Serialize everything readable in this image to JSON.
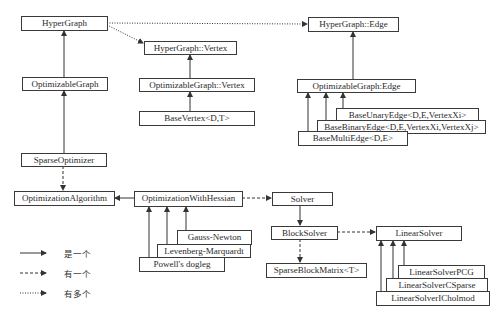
{
  "nodes": {
    "hypergraph": "HyperGraph",
    "hypergraph_vertex": "HyperGraph::Vertex",
    "hypergraph_edge": "HyperGraph::Edge",
    "optimizable_graph": "OptimizableGraph",
    "optimizable_graph_vertex": "OptimizableGraph::Vertex",
    "base_vertex": "BaseVertex<D,T>",
    "optimizable_graph_edge": "OptimizableGraph:Edge",
    "base_unary_edge": "BaseUnaryEdge<D,E,VertexXi>",
    "base_binary_edge": "BaseBinaryEdge<D,E,VertexXi,VertexXj>",
    "base_multi_edge": "BaseMultiEdge<D,E>",
    "sparse_optimizer": "SparseOptimizer",
    "optimization_algorithm": "OptimizationAlgorithm",
    "optimization_with_hessian": "OptimizationWithHessian",
    "gauss_newton": "Gauss-Newton",
    "levenberg_marquardt": "Levenberg-Marquardt",
    "powells_dogleg": "Powell's dogleg",
    "solver": "Solver",
    "block_solver": "BlockSolver",
    "sparse_block_matrix": "SparseBlockMatrix<T>",
    "linear_solver": "LinearSolver",
    "linear_solver_pcg": "LinearSolverPCG",
    "linear_solver_csparse": "LinearSolverCSparse",
    "linear_solver_icholmod": "LinearSolverICholmod"
  },
  "legend": {
    "is_a": "是一个",
    "has_a": "有一个",
    "has_many": "有多个"
  },
  "edges": [
    {
      "from": "optimizable_graph",
      "to": "hypergraph",
      "type": "is_a"
    },
    {
      "from": "hypergraph",
      "to": "hypergraph_vertex",
      "type": "has_many"
    },
    {
      "from": "hypergraph",
      "to": "hypergraph_edge",
      "type": "has_many"
    },
    {
      "from": "optimizable_graph_vertex",
      "to": "hypergraph_vertex",
      "type": "is_a"
    },
    {
      "from": "base_vertex",
      "to": "optimizable_graph_vertex",
      "type": "is_a"
    },
    {
      "from": "optimizable_graph_edge",
      "to": "hypergraph_edge",
      "type": "is_a"
    },
    {
      "from": "base_unary_edge",
      "to": "optimizable_graph_edge",
      "type": "is_a"
    },
    {
      "from": "base_binary_edge",
      "to": "optimizable_graph_edge",
      "type": "is_a"
    },
    {
      "from": "base_multi_edge",
      "to": "optimizable_graph_edge",
      "type": "is_a"
    },
    {
      "from": "sparse_optimizer",
      "to": "optimizable_graph",
      "type": "is_a"
    },
    {
      "from": "sparse_optimizer",
      "to": "optimization_algorithm",
      "type": "has_a"
    },
    {
      "from": "optimization_with_hessian",
      "to": "optimization_algorithm",
      "type": "is_a"
    },
    {
      "from": "gauss_newton",
      "to": "optimization_with_hessian",
      "type": "is_a"
    },
    {
      "from": "levenberg_marquardt",
      "to": "optimization_with_hessian",
      "type": "is_a"
    },
    {
      "from": "powells_dogleg",
      "to": "optimization_with_hessian",
      "type": "is_a"
    },
    {
      "from": "optimization_with_hessian",
      "to": "solver",
      "type": "has_a"
    },
    {
      "from": "block_solver",
      "to": "solver",
      "type": "is_a"
    },
    {
      "from": "block_solver",
      "to": "sparse_block_matrix",
      "type": "has_a"
    },
    {
      "from": "block_solver",
      "to": "linear_solver",
      "type": "has_a"
    },
    {
      "from": "linear_solver_pcg",
      "to": "linear_solver",
      "type": "is_a"
    },
    {
      "from": "linear_solver_csparse",
      "to": "linear_solver",
      "type": "is_a"
    },
    {
      "from": "linear_solver_icholmod",
      "to": "linear_solver",
      "type": "is_a"
    }
  ],
  "colors": {
    "line": "#333333",
    "box_border": "#3a3a3a",
    "background": "#ffffff"
  }
}
